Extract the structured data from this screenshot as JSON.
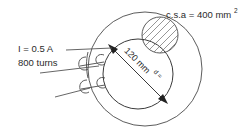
{
  "figure": {
    "kind": "toroid-coil-cross-section-diagram",
    "background_color": "#ffffff",
    "line_color": "#4a4a4a",
    "text_color": "#2b2b2b"
  },
  "labels": {
    "csa": {
      "text": "c.s.a = 400 mm",
      "superscript": "2",
      "name": "cross-sectional-area-label"
    },
    "current": {
      "text": "I = 0.5 A",
      "name": "current-label"
    },
    "turns": {
      "text": "800 turns",
      "name": "turns-label"
    },
    "diameter_symbol": {
      "text": "d =",
      "name": "diameter-symbol-label"
    },
    "diameter_value": {
      "text": "120 mm",
      "name": "diameter-value-label"
    }
  },
  "geometry": {
    "outer_circle": {
      "cx": 145,
      "cy": 69,
      "r": 57
    },
    "inner_circle": {
      "cx": 138,
      "cy": 74,
      "r": 35
    },
    "section_circle": {
      "cx": 160,
      "cy": 35,
      "r": 18
    },
    "diameter_arrow": {
      "x1": 110,
      "y1": 46,
      "x2": 166,
      "y2": 102
    }
  }
}
